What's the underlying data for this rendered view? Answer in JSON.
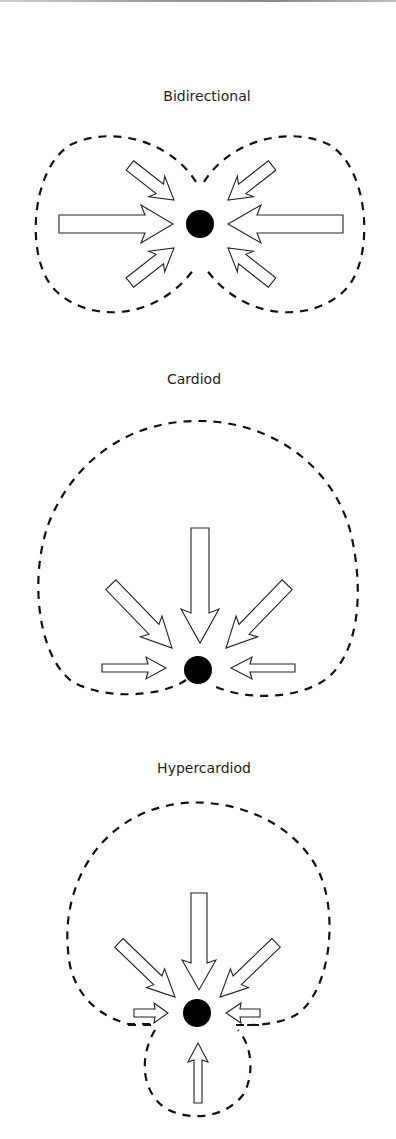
{
  "figure": {
    "panels": [
      {
        "id": "bidirectional",
        "title": "Bidirectional",
        "pattern": "figure-eight",
        "arrows": 6,
        "description": "Two dashed lobes left and right of the microphone dot; arrows enter from left and right sides"
      },
      {
        "id": "cardiod",
        "title": "Cardiod",
        "pattern": "heart-shaped",
        "arrows": 5,
        "description": "Single dashed heart-shaped lobe above the microphone dot; arrows enter from top, diagonals and sides"
      },
      {
        "id": "hypercardiod",
        "title": "Hypercardiod",
        "pattern": "heart-shaped with small rear lobe",
        "arrows": 6,
        "description": "Large dashed front lobe above plus small dashed rear lobe below the microphone dot"
      }
    ],
    "colors": {
      "line": "#111111",
      "dot": "#000000",
      "arrow_fill": "#ffffff",
      "background": "#ffffff"
    }
  }
}
